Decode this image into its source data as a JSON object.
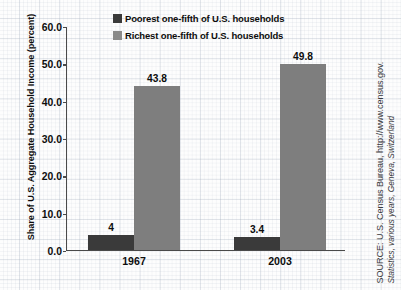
{
  "chart_data": {
    "type": "bar",
    "title": "",
    "subtitle": "",
    "xlabel": "",
    "ylabel": "Share of U.S. Aggregate Household Income (percent)",
    "categories": [
      "1967",
      "2003"
    ],
    "series": [
      {
        "name": "Poorest one-fifth of U.S. households",
        "color": "#3a3a3a",
        "values": [
          4,
          3.4
        ],
        "labels": [
          "4",
          "3.4"
        ]
      },
      {
        "name": "Richest one-fifth of U.S. households",
        "color": "#7e7e7e",
        "values": [
          43.8,
          49.8
        ],
        "labels": [
          "43.8",
          "49.8"
        ]
      }
    ],
    "ylim": [
      0.0,
      60.0
    ],
    "ytick_values": [
      60.0,
      50.0,
      40.0,
      30.0,
      20.0,
      10.0,
      0.0
    ],
    "ytick_labels": [
      "60.0",
      "50.0",
      "40.0",
      "30.0",
      "20.0",
      "10.0",
      "0.0"
    ],
    "grid": true,
    "legend_position": "top-center-inside",
    "annotations": [
      "SOURCE: U.S. Census Bureau, http://www.census.gov.",
      "Statistics, various years, Geneva, Switzerland"
    ]
  },
  "legend": {
    "entries": [
      {
        "label": "Poorest one-fifth of U.S. households",
        "color": "#3a3a3a"
      },
      {
        "label": "Richest one-fifth of U.S. households",
        "color": "#8a8a8a"
      }
    ]
  },
  "source": {
    "line1": "SOURCE: U.S. Census Bureau, http://www.census.gov.",
    "line2": "Statistics, various years, Geneva, Switzerland"
  }
}
